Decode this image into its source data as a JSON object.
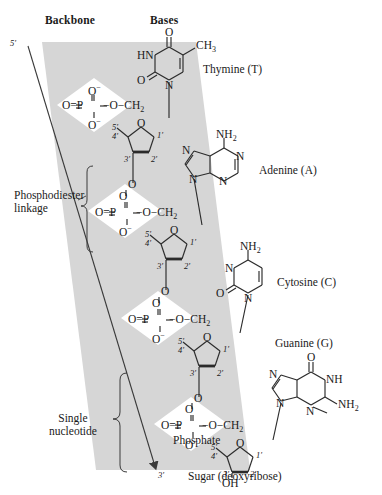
{
  "figure": {
    "headers": {
      "backbone": "Backbone",
      "bases": "Bases"
    },
    "termini": {
      "five_prime": "5′",
      "three_prime": "3′"
    },
    "callouts": {
      "phosphodiester": "Phosphodiester\nlinkage",
      "phosphodiester_line1": "Phosphodiester",
      "phosphodiester_line2": "linkage",
      "single_nucleotide_line1": "Single",
      "single_nucleotide_line2": "nucleotide",
      "phosphate": "Phosphate",
      "sugar": "Sugar (deoxyribose)"
    },
    "colors": {
      "band": "#d6d6d6",
      "band_edge": "#9a9a9a",
      "ink": "#1a1a1a",
      "bond": "#2b2b2b",
      "diamond": "#ffffff"
    },
    "bases": [
      {
        "id": "thymine",
        "name": "Thymine (T)",
        "letter": "T",
        "kind": "pyrimidine",
        "atoms": [
          "O",
          "HN",
          "O",
          "N",
          "CH3"
        ],
        "substituent": "CH3"
      },
      {
        "id": "adenine",
        "name": "Adenine (A)",
        "letter": "A",
        "kind": "purine",
        "atoms": [
          "NH2",
          "N",
          "N",
          "N",
          "N"
        ],
        "substituent": "NH2"
      },
      {
        "id": "cytosine",
        "name": "Cytosine (C)",
        "letter": "C",
        "kind": "pyrimidine",
        "atoms": [
          "NH2",
          "N",
          "O",
          "N"
        ],
        "substituent": "NH2"
      },
      {
        "id": "guanine",
        "name": "Guanine (G)",
        "letter": "G",
        "kind": "purine",
        "atoms": [
          "O",
          "N",
          "NH",
          "N",
          "N",
          "NH2"
        ],
        "substituent": "NH2"
      }
    ],
    "phosphate_group": {
      "formula_left": "O=P",
      "formula_right": "O",
      "top_oxygen": "O",
      "bottom_oxygen": "O",
      "charge": "−",
      "methylene": "CH",
      "methylene_sub": "2",
      "bridge": "O"
    },
    "sugar_carbons": [
      "5′",
      "4′",
      "3′",
      "2′",
      "1′"
    ],
    "sugar_ring_oxygen": "O",
    "terminal_hydroxyl": "OH",
    "linker_oxygen": "O"
  }
}
